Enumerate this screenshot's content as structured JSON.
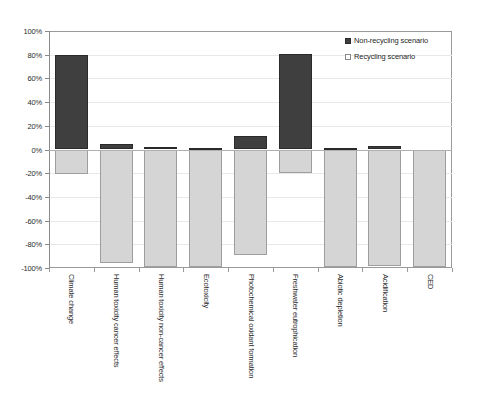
{
  "chart_data": {
    "type": "bar",
    "title": "",
    "subtitle": "",
    "xlabel": "",
    "ylabel": "",
    "ylim": [
      -100,
      100
    ],
    "ytick_step": 20,
    "ytick_labels": [
      "100%",
      "80%",
      "60%",
      "40%",
      "20%",
      "0%",
      "-20%",
      "-40%",
      "-60%",
      "-80%",
      "-100%"
    ],
    "ytick_values": [
      100,
      80,
      60,
      40,
      20,
      0,
      -20,
      -40,
      -60,
      -80,
      -100
    ],
    "grid": true,
    "legend_position": "top-right",
    "value_unit": "%",
    "categories": [
      "Climate change",
      "Human toxicity cancer effects",
      "Human toxicity non-cancer effects",
      "Ecotoxicity",
      "Photochemical oxidant formation",
      "Freshwater eutrophication",
      "Abiotic depletion",
      "Acidification",
      "CED"
    ],
    "series": [
      {
        "name": "Non-recycling scenario",
        "color": "#3f3f3f",
        "values": [
          80,
          5,
          2,
          1.5,
          11,
          81,
          1,
          3,
          0
        ]
      },
      {
        "name": "Recycling scenario",
        "color": "#d5d5d5",
        "values": [
          -21,
          -96,
          -99,
          -99,
          -89,
          -20,
          -99,
          -98,
          -99
        ]
      }
    ]
  },
  "legend": {
    "items": [
      {
        "label": "Non-recycling scenario",
        "swatch": "dark"
      },
      {
        "label": "Recycling scenario",
        "swatch": "light"
      }
    ]
  },
  "colors": {
    "non_recycling": "#3f3f3f",
    "recycling": "#d5d5d5",
    "axis": "#8a8a8a",
    "grid": "#e8e8e8",
    "background": "#ffffff"
  }
}
